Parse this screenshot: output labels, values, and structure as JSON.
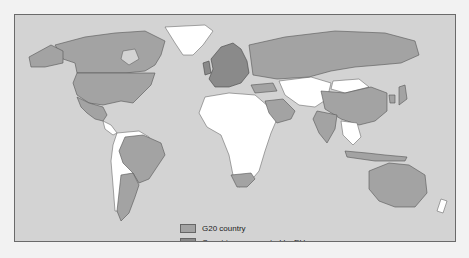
{
  "map": {
    "title": "",
    "colors": {
      "ocean": "#d3d3d3",
      "g20": "#a3a3a3",
      "eu": "#8a8a8a",
      "other": "#ffffff",
      "border": "#555555"
    },
    "legend": [
      {
        "label": "G20 country",
        "color": "#a3a3a3"
      },
      {
        "label": "Countries represented by EU",
        "color": "#8a8a8a"
      }
    ],
    "regions_g20": [
      "Canada",
      "United States",
      "Mexico",
      "Brazil",
      "Argentina",
      "South Africa",
      "Saudi Arabia",
      "Turkey",
      "Russia",
      "India",
      "China",
      "Japan",
      "South Korea",
      "Indonesia",
      "Australia"
    ],
    "regions_eu": [
      "European Union member states"
    ]
  }
}
